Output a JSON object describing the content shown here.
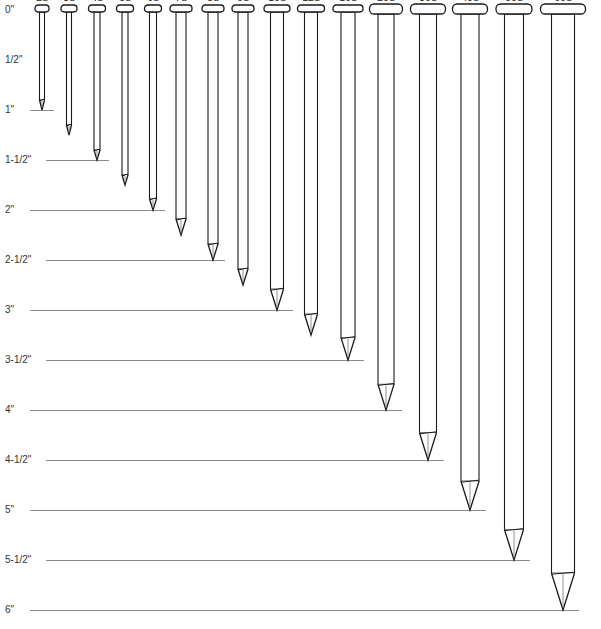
{
  "diagram": {
    "scale": {
      "unit": "inches",
      "origin_y": 10,
      "px_per_inch": 100,
      "ruler_labels": [
        {
          "label": "0\"",
          "inches": 0
        },
        {
          "label": "1/2\"",
          "inches": 0.5
        },
        {
          "label": "1\"",
          "inches": 1
        },
        {
          "label": "1-1/2\"",
          "inches": 1.5
        },
        {
          "label": "2\"",
          "inches": 2
        },
        {
          "label": "2-1/2\"",
          "inches": 2.5
        },
        {
          "label": "3\"",
          "inches": 3
        },
        {
          "label": "3-1/2\"",
          "inches": 3.5
        },
        {
          "label": "4\"",
          "inches": 4
        },
        {
          "label": "4-1/2\"",
          "inches": 4.5
        },
        {
          "label": "5\"",
          "inches": 5
        },
        {
          "label": "5-1/2\"",
          "inches": 5.5
        },
        {
          "label": "6\"",
          "inches": 6
        }
      ]
    },
    "nails": [
      {
        "size": "2d",
        "length_in": 1.0,
        "x": 42,
        "head_w": 14,
        "shank_w": 5
      },
      {
        "size": "3d",
        "length_in": 1.25,
        "x": 69,
        "head_w": 16,
        "shank_w": 5
      },
      {
        "size": "4d",
        "length_in": 1.5,
        "x": 97,
        "head_w": 17,
        "shank_w": 6
      },
      {
        "size": "5d",
        "length_in": 1.75,
        "x": 125,
        "head_w": 17,
        "shank_w": 6
      },
      {
        "size": "6d",
        "length_in": 2.0,
        "x": 153,
        "head_w": 17,
        "shank_w": 7
      },
      {
        "size": "7d",
        "length_in": 2.25,
        "x": 181,
        "head_w": 22,
        "shank_w": 10
      },
      {
        "size": "8d",
        "length_in": 2.5,
        "x": 213,
        "head_w": 22,
        "shank_w": 10
      },
      {
        "size": "9d",
        "length_in": 2.75,
        "x": 243,
        "head_w": 22,
        "shank_w": 10
      },
      {
        "size": "10d",
        "length_in": 3.0,
        "x": 277,
        "head_w": 26,
        "shank_w": 13
      },
      {
        "size": "12d",
        "length_in": 3.25,
        "x": 311,
        "head_w": 27,
        "shank_w": 13
      },
      {
        "size": "16d",
        "length_in": 3.5,
        "x": 348,
        "head_w": 30,
        "shank_w": 14
      },
      {
        "size": "20d",
        "length_in": 4.0,
        "x": 386,
        "head_w": 33,
        "shank_w": 16
      },
      {
        "size": "30d",
        "length_in": 4.5,
        "x": 428,
        "head_w": 35,
        "shank_w": 17
      },
      {
        "size": "40d",
        "length_in": 5.0,
        "x": 470,
        "head_w": 35,
        "shank_w": 18
      },
      {
        "size": "50d",
        "length_in": 5.5,
        "x": 514,
        "head_w": 36,
        "shank_w": 19
      },
      {
        "size": "60d",
        "length_in": 6.0,
        "x": 563,
        "head_w": 45,
        "shank_w": 23
      }
    ],
    "colors": {
      "outline": "#1a1a1a",
      "ruler_line": "#8a8a8a",
      "background": "#ffffff"
    }
  }
}
